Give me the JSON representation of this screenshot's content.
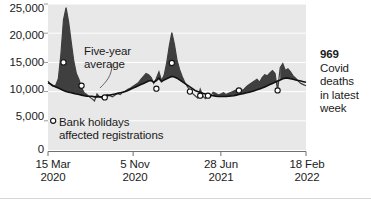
{
  "chart_data": {
    "type": "area",
    "title": "",
    "subtitle": "",
    "xlabel": "",
    "ylabel": "",
    "ylim": [
      0,
      25000
    ],
    "grid": true,
    "legend_position": "annotation",
    "y_ticks": [
      "0",
      "5,000",
      "10,000",
      "15,000",
      "20,000",
      "25,000"
    ],
    "y_tick_values": [
      0,
      5000,
      10000,
      15000,
      20000,
      25000
    ],
    "x_ticks": [
      {
        "line1": "15 Mar",
        "line2": "2020"
      },
      {
        "line1": "5 Nov",
        "line2": "2020"
      },
      {
        "line1": "28 Jun",
        "line2": "2021"
      },
      {
        "line1": "18 Feb",
        "line2": "2022"
      }
    ],
    "x_tick_index": [
      0,
      33,
      67,
      100
    ],
    "series": [
      {
        "name": "Weekly deaths registered",
        "color": "#3f3f3f",
        "values": [
          11800,
          11200,
          10900,
          11100,
          12200,
          16400,
          22300,
          24400,
          21900,
          18500,
          15200,
          13100,
          12100,
          10700,
          9800,
          9500,
          9100,
          8800,
          8400,
          9600,
          9100,
          8900,
          9200,
          9500,
          9300,
          9100,
          9400,
          9700,
          9500,
          9900,
          10100,
          10400,
          10600,
          10900,
          11200,
          11500,
          12100,
          12600,
          13100,
          12900,
          12400,
          11400,
          12300,
          13400,
          11900,
          12800,
          14900,
          17800,
          20100,
          18100,
          15400,
          13800,
          12600,
          11600,
          10900,
          10200,
          9700,
          9300,
          8900,
          10400,
          9200,
          8800,
          9500,
          9100,
          9900,
          9700,
          9400,
          9600,
          9800,
          9500,
          9700,
          9900,
          10100,
          10300,
          10500,
          10200,
          10400,
          10900,
          11200,
          11500,
          11800,
          12100,
          11600,
          12400,
          12900,
          12700,
          13200,
          13600,
          13100,
          10200,
          14100,
          14800,
          13600,
          13900,
          13400,
          12700,
          12300,
          11800,
          11400,
          11200,
          11000
        ]
      },
      {
        "name": "Five-year average",
        "color": "#111111",
        "values": [
          11500,
          11300,
          11000,
          10800,
          10600,
          10400,
          10200,
          10000,
          9900,
          9800,
          9700,
          9600,
          9500,
          9400,
          9300,
          9200,
          9200,
          9200,
          9100,
          9100,
          9100,
          9100,
          9200,
          9300,
          9400,
          9500,
          9600,
          9700,
          9800,
          9900,
          10000,
          10200,
          10400,
          10600,
          10800,
          11000,
          11200,
          11400,
          11600,
          11800,
          11900,
          11600,
          11900,
          12300,
          11700,
          12000,
          12200,
          12400,
          12600,
          12500,
          12300,
          12000,
          11700,
          11400,
          11100,
          10800,
          10500,
          10200,
          10000,
          9900,
          9700,
          9600,
          9500,
          9400,
          9300,
          9200,
          9150,
          9150,
          9150,
          9150,
          9200,
          9250,
          9300,
          9400,
          9500,
          9600,
          9700,
          9800,
          9900,
          10000,
          10150,
          10300,
          10450,
          10600,
          10800,
          11000,
          11200,
          11400,
          11600,
          11800,
          12000,
          12200,
          12300,
          12300,
          12200,
          12100,
          12000,
          11900,
          11800,
          11700,
          11600
        ]
      }
    ],
    "markers": [
      {
        "label": "bank-holiday-marker",
        "x_index": 6,
        "value": 15000
      },
      {
        "label": "bank-holiday-marker",
        "x_index": 13,
        "value": 11000
      },
      {
        "label": "bank-holiday-marker",
        "x_index": 22,
        "value": 9000
      },
      {
        "label": "bank-holiday-marker",
        "x_index": 42,
        "value": 10500
      },
      {
        "label": "bank-holiday-marker",
        "x_index": 48,
        "value": 14900
      },
      {
        "label": "bank-holiday-marker",
        "x_index": 55,
        "value": 10000
      },
      {
        "label": "bank-holiday-marker",
        "x_index": 59,
        "value": 9300
      },
      {
        "label": "bank-holiday-marker",
        "x_index": 62,
        "value": 9300
      },
      {
        "label": "bank-holiday-marker",
        "x_index": 74,
        "value": 10200
      },
      {
        "label": "bank-holiday-marker",
        "x_index": 89,
        "value": 10200
      },
      {
        "label": "legend-marker",
        "x_index": 2,
        "value": 5000
      }
    ],
    "annotations": [
      {
        "name": "five-year-average-label",
        "line1": "Five-year",
        "line2": "average"
      },
      {
        "name": "bank-holidays-label",
        "line1": "Bank holidays",
        "line2": "affected registrations"
      },
      {
        "name": "latest-week-callout",
        "value": "969",
        "line1": "Covid",
        "line2": "deaths",
        "line3": "in latest",
        "line4": "week"
      }
    ]
  },
  "axes": {
    "plot_bg": "#e8e8e8",
    "gridline_color": "#ffffff",
    "axis_color": "#6f6f6f",
    "tick_color": "#6f6f6f"
  },
  "callout": {
    "value": "969",
    "l1": "Covid",
    "l2": "deaths",
    "l3": "in latest",
    "l4": "week"
  },
  "annotations": {
    "avg_l1": "Five-year",
    "avg_l2": "average",
    "bank_l1": "Bank holidays",
    "bank_l2": "affected registrations"
  },
  "y_labels": {
    "t0": "0",
    "t1": "5,000",
    "t2": "10,000",
    "t3": "15,000",
    "t4": "20,000",
    "t5": "25,000"
  },
  "x_labels": {
    "x0a": "15 Mar",
    "x0b": "2020",
    "x1a": "5 Nov",
    "x1b": "2020",
    "x2a": "28 Jun",
    "x2b": "2021",
    "x3a": "18 Feb",
    "x3b": "2022"
  }
}
